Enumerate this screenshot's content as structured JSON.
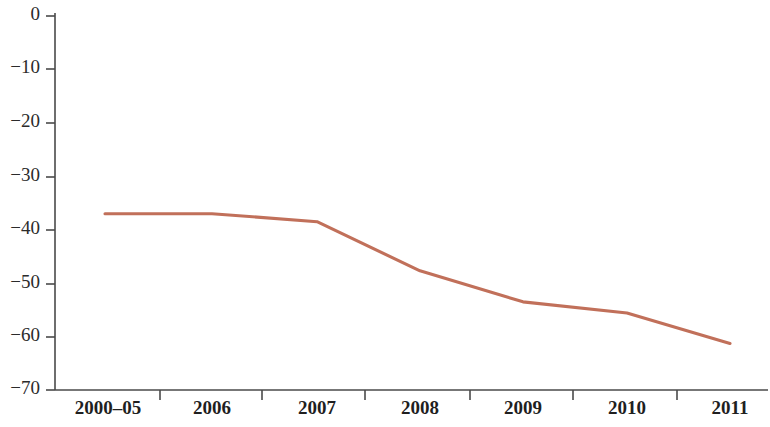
{
  "chart_data": {
    "type": "line",
    "title": "",
    "subtitle": "",
    "xlabel": "",
    "ylabel": "",
    "categories": [
      "2000–05",
      "2006",
      "2007",
      "2008",
      "2009",
      "2010",
      "2011"
    ],
    "series": [
      {
        "name": "series-1",
        "color": "#c1705a",
        "values": [
          -37,
          -37,
          -38.5,
          -47.7,
          -53.5,
          -55.6,
          -61.3
        ]
      }
    ],
    "ylim": [
      -70,
      0
    ],
    "yticks": [
      0,
      -10,
      -20,
      -30,
      -40,
      -50,
      -60,
      -70
    ],
    "ytick_labels": [
      "0",
      "−10",
      "−20",
      "−30",
      "−40",
      "−50",
      "−60",
      "−70"
    ],
    "xtick_labels": [
      "2000–05",
      "2006",
      "2007",
      "2008",
      "2009",
      "2010",
      "2011"
    ],
    "grid": false,
    "legend": "none",
    "annotations": []
  },
  "axes": {
    "y_axis_name": "y-axis",
    "x_axis_name": "x-axis"
  },
  "colors": {
    "line": "#c1705a",
    "axis": "#4a4a4a",
    "text": "#1f1f1f",
    "background": "#ffffff"
  }
}
